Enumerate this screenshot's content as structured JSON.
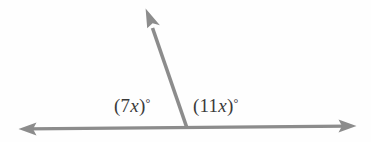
{
  "figure": {
    "name": "linear-pair-angle-diagram",
    "background_color": "#fefefe",
    "stroke_color": "#8c8c8c",
    "text_color": "#3a3a3a",
    "labels": {
      "left_angle": {
        "full_text": "(7x)°",
        "open_paren": "(",
        "coefficient": "7",
        "variable": "x",
        "close_paren": ")",
        "degree": "°"
      },
      "right_angle": {
        "full_text": "(11x)°",
        "open_paren": "(",
        "coefficient": "11",
        "variable": "x",
        "close_paren": ")",
        "degree": "°"
      }
    },
    "geometry": {
      "vertex": {
        "x": 187,
        "y": 127
      },
      "horizontal_line": {
        "left_end": {
          "x": 18,
          "y": 129
        },
        "right_end": {
          "x": 356,
          "y": 126
        },
        "arrows": "both"
      },
      "slanted_ray": {
        "start": {
          "x": 187,
          "y": 127
        },
        "tip": {
          "x": 146,
          "y": 9
        },
        "arrows": "tip"
      }
    }
  }
}
